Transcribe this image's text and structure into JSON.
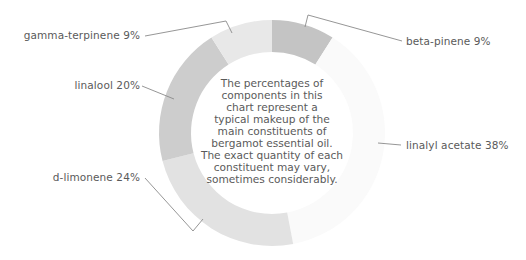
{
  "chart_data": {
    "type": "pie",
    "subtype": "donut",
    "title": "",
    "center_note": "The percentages of components in this chart represent a typical makeup of the main constituents of bergamot essential oil. The exact quantity of each constituent may vary, sometimes considerably.",
    "categories": [
      "beta-pinene",
      "linalyl acetate",
      "d-limonene",
      "linalool",
      "gamma-terpinene"
    ],
    "values": [
      9,
      38,
      24,
      20,
      9
    ],
    "unit": "%",
    "labels": [
      "beta-pinene 9%",
      "linalyl acetate 38%",
      "d-limonene 24%",
      "linalool 20%",
      "gamma-terpinene 9%"
    ],
    "colors": [
      "#c4c4c4",
      "#fafafa",
      "#e2e2e2",
      "#cdcdcd",
      "#e8e8e8"
    ],
    "start_angle_deg": 0,
    "direction": "clockwise",
    "legend": "none (direct labels with leader lines)"
  },
  "center_lines": [
    "The percentages of",
    "components in this",
    "chart represent a",
    "typical makeup of the",
    "main constituents of",
    "bergamot essential oil.",
    "The exact quantity of each",
    "constituent may vary,",
    "sometimes considerably."
  ]
}
